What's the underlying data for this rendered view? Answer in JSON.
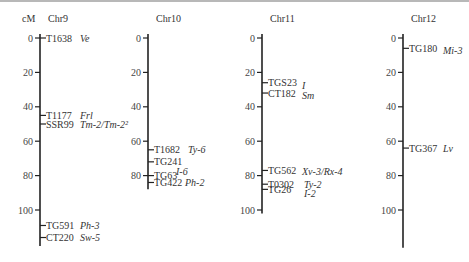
{
  "unit_label": "cM",
  "scale": {
    "px_per_cM": 1.72,
    "zero_y": 38
  },
  "chromosomes": [
    {
      "name": "Chr9",
      "axis_x": 40,
      "length_cM": 121,
      "ticks": [
        0,
        20,
        40,
        60,
        80,
        100
      ],
      "markers": [
        {
          "marker": "T1638",
          "gene": "Ve",
          "cM": 0
        },
        {
          "marker": "T1177",
          "gene": "Frl",
          "cM": 45
        },
        {
          "marker": "SSR99",
          "gene": "Tm-2/Tm-2²",
          "cM": 50
        },
        {
          "marker": "TG591",
          "gene": "Ph-3",
          "cM": 109
        },
        {
          "marker": "CT220",
          "gene": "Sw-5",
          "cM": 116
        }
      ]
    },
    {
      "name": "Chr10",
      "axis_x": 148,
      "length_cM": 88,
      "ticks": [
        0,
        20,
        40,
        60,
        80
      ],
      "markers": [
        {
          "marker": "T1682",
          "gene": "Ty-6",
          "cM": 65
        },
        {
          "marker": "TG241",
          "gene": "I-6",
          "cM": 72
        },
        {
          "marker": "TG63",
          "gene": "",
          "cM": 80
        },
        {
          "marker": "TG422",
          "gene": "Ph-2",
          "cM": 84
        }
      ]
    },
    {
      "name": "Chr11",
      "axis_x": 262,
      "length_cM": 102,
      "ticks": [
        0,
        20,
        40,
        60,
        80,
        100
      ],
      "markers": [
        {
          "marker": "TGS23",
          "gene": "I",
          "cM": 26
        },
        {
          "marker": "CT182",
          "gene": "Sm",
          "cM": 32
        },
        {
          "marker": "TG562",
          "gene": "Xv-3/Rx-4",
          "cM": 77
        },
        {
          "marker": "T0302",
          "gene": "Ty-2",
          "cM": 85
        },
        {
          "marker": "TG26",
          "gene": "I-2",
          "cM": 88
        }
      ]
    },
    {
      "name": "Chr12",
      "axis_x": 403,
      "length_cM": 122,
      "ticks": [
        0,
        20,
        40,
        60,
        80,
        100
      ],
      "markers": [
        {
          "marker": "TG180",
          "gene": "Mi-3",
          "cM": 6
        },
        {
          "marker": "TG367",
          "gene": "Lv",
          "cM": 64
        }
      ]
    }
  ]
}
